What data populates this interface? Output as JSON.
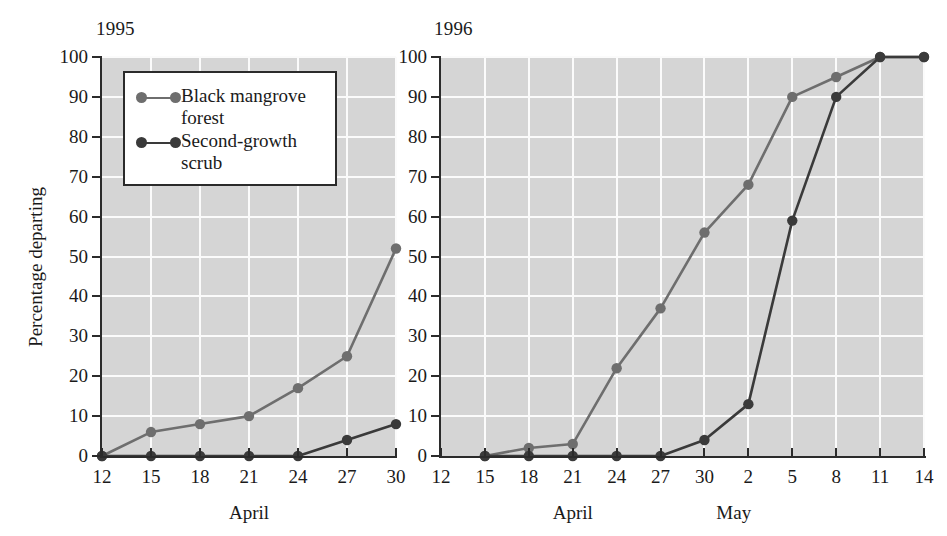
{
  "figure": {
    "background": "#ffffff",
    "plot_background": "#d5d5d5",
    "gridline_color": "#fbfbfb",
    "axis_color": "#2b2b2b"
  },
  "legend": {
    "entries": [
      {
        "label": "Black mangrove forest",
        "color": "#6e6e6e",
        "key": "black-mangrove-forest"
      },
      {
        "label": "Second-growth scrub",
        "color": "#3a3a3a",
        "key": "second-growth-scrub"
      }
    ]
  },
  "panels": [
    {
      "id": "1995",
      "title": "1995",
      "ylabel": "Percentage departing",
      "xcaption": [
        {
          "text": "April",
          "at": 21
        }
      ],
      "yticks": [
        0,
        10,
        20,
        30,
        40,
        50,
        60,
        70,
        80,
        90,
        100
      ],
      "ylim": [
        0,
        100
      ],
      "xticks": [
        "12",
        "15",
        "18",
        "21",
        "24",
        "27",
        "30"
      ],
      "xvalues": [
        12,
        15,
        18,
        21,
        24,
        27,
        30
      ],
      "xlim": [
        12,
        30
      ]
    },
    {
      "id": "1996",
      "title": "1996",
      "ylabel": "",
      "xcaption": [
        {
          "text": "April",
          "at": 21
        },
        {
          "text": "May",
          "at": 32
        }
      ],
      "yticks": [
        0,
        10,
        20,
        30,
        40,
        50,
        60,
        70,
        80,
        90,
        100
      ],
      "ylim": [
        0,
        100
      ],
      "xticks": [
        "12",
        "15",
        "18",
        "21",
        "24",
        "27",
        "30",
        "2",
        "5",
        "8",
        "11",
        "14"
      ],
      "xvalues": [
        12,
        15,
        18,
        21,
        24,
        27,
        30,
        33,
        36,
        39,
        42,
        45
      ],
      "xlim": [
        12,
        45
      ]
    }
  ],
  "chart_data": [
    {
      "type": "line",
      "title": "1995",
      "xlabel": "April",
      "ylabel": "Percentage departing",
      "ylim": [
        0,
        100
      ],
      "xlim": [
        12,
        30
      ],
      "grid": true,
      "legend_position": "upper-left-inset",
      "categories": [
        "12",
        "15",
        "18",
        "21",
        "24",
        "27",
        "30"
      ],
      "x": [
        12,
        15,
        18,
        21,
        24,
        27,
        30
      ],
      "series": [
        {
          "name": "Black mangrove forest",
          "color": "#6e6e6e",
          "values": [
            0,
            6,
            8,
            10,
            17,
            25,
            52
          ]
        },
        {
          "name": "Second-growth scrub",
          "color": "#3a3a3a",
          "values": [
            0,
            0,
            0,
            0,
            0,
            4,
            8
          ]
        }
      ]
    },
    {
      "type": "line",
      "title": "1996",
      "xlabel": "April / May",
      "ylabel": "Percentage departing",
      "ylim": [
        0,
        100
      ],
      "xlim": [
        12,
        45
      ],
      "grid": true,
      "legend_position": "none",
      "categories": [
        "15",
        "18",
        "21",
        "24",
        "27",
        "30",
        "2",
        "5",
        "8",
        "11",
        "14"
      ],
      "x": [
        15,
        18,
        21,
        24,
        27,
        30,
        33,
        36,
        39,
        42,
        45
      ],
      "series": [
        {
          "name": "Black mangrove forest",
          "color": "#6e6e6e",
          "values": [
            0,
            2,
            3,
            22,
            37,
            56,
            68,
            90,
            95,
            100,
            100
          ]
        },
        {
          "name": "Second-growth scrub",
          "color": "#3a3a3a",
          "values": [
            0,
            0,
            0,
            0,
            0,
            4,
            13,
            59,
            90,
            100,
            100
          ]
        }
      ]
    }
  ]
}
